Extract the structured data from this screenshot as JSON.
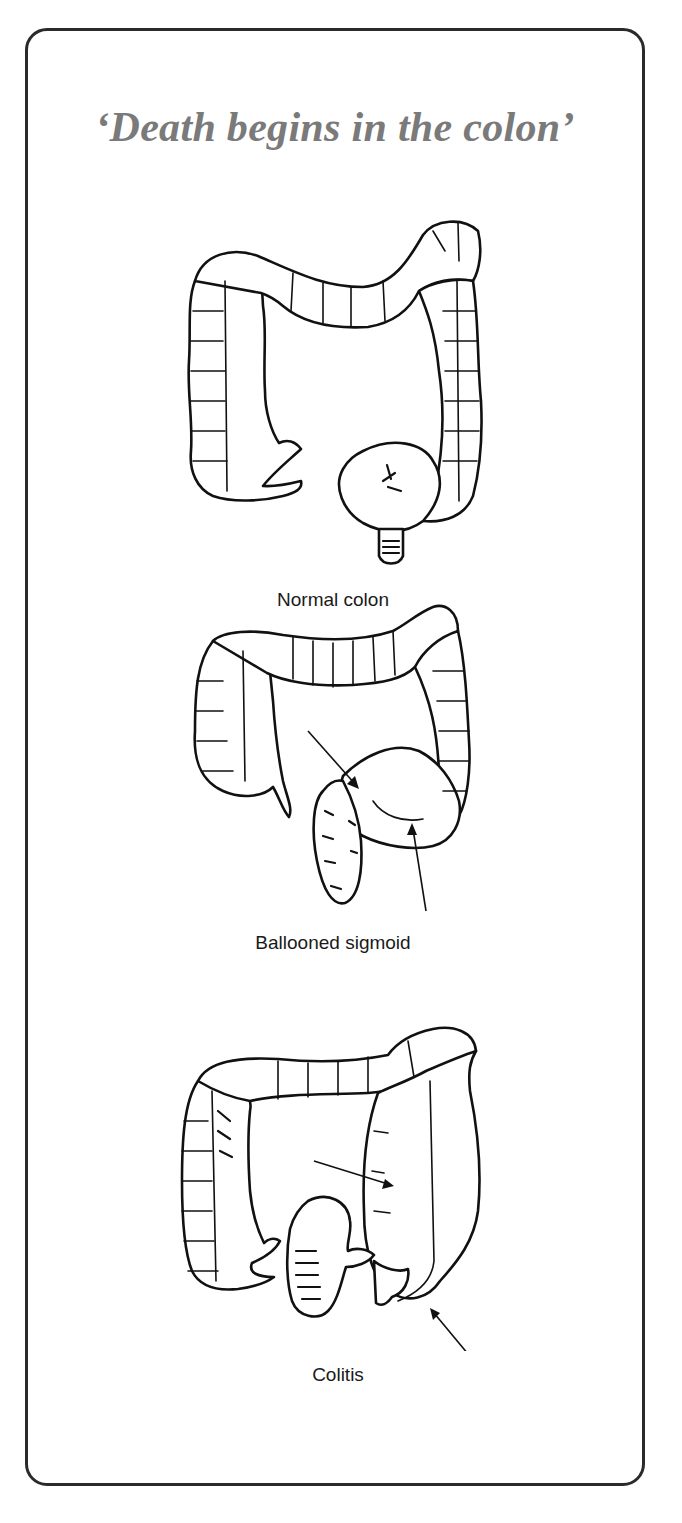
{
  "page": {
    "title": "‘Death begins in the colon’"
  },
  "figures": [
    {
      "id": "normal",
      "caption": "Normal colon"
    },
    {
      "id": "ballooned",
      "caption": "Ballooned sigmoid"
    },
    {
      "id": "colitis",
      "caption": "Colitis"
    }
  ],
  "colors": {
    "title": "#7a7a7a",
    "border": "#2a2a2a",
    "ink": "#111111",
    "background": "#ffffff"
  }
}
